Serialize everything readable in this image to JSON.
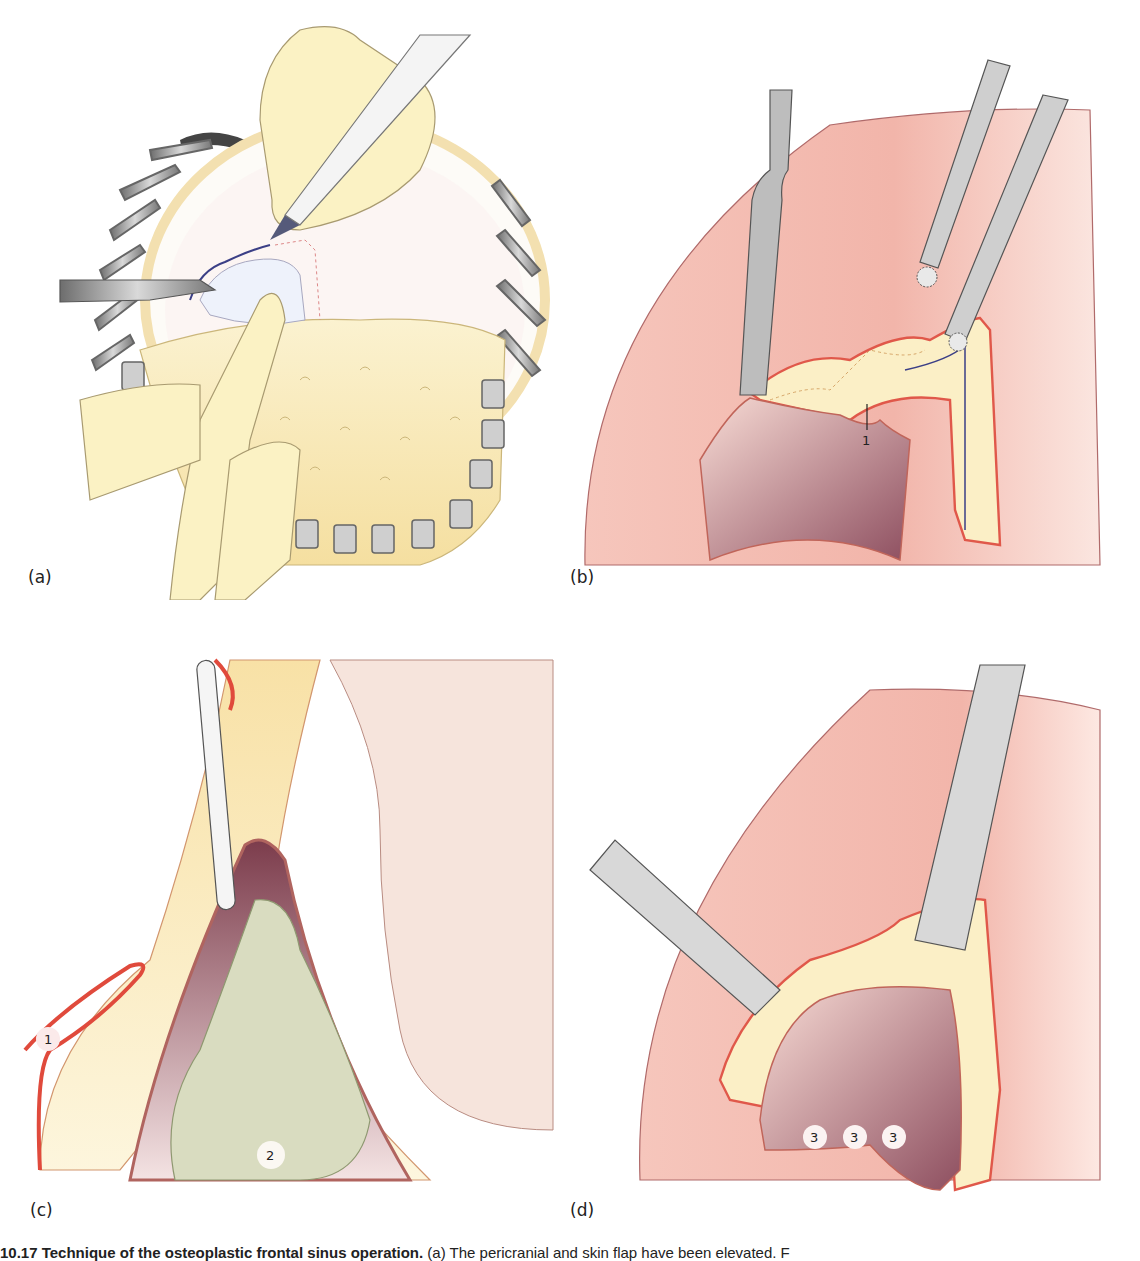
{
  "figure": {
    "panels": [
      {
        "id": "a",
        "label": "(a)",
        "description": "Osteoplastic flap: frontal bone exposure with retractors, surgeon's fingers, marking pen and scalpel"
      },
      {
        "id": "b",
        "label": "(b)",
        "description": "Frontal sinus opened with elevator and burs",
        "callouts": [
          "1"
        ]
      },
      {
        "id": "c",
        "label": "(c)",
        "description": "Sagittal section with probe in sinus, contents",
        "callouts": [
          "1",
          "2"
        ]
      },
      {
        "id": "d",
        "label": "(d)",
        "description": "Sinus cavity with chisels",
        "callouts": [
          "3",
          "3",
          "3"
        ]
      }
    ],
    "caption": {
      "number": "10.17",
      "title": "Technique of the osteoplastic frontal sinus operation.",
      "text": "(a) The pericranial and skin flap have been elevated. F"
    }
  },
  "colors": {
    "tissue_pink": "#f2b7ad",
    "tissue_light": "#fbe3dc",
    "bone_yellow": "#f8e6b0",
    "mucosa_red": "#e2574a",
    "cavity_dark": "#8a4a5a",
    "instrument_gray": "#b9b9b9",
    "skin_glove": "#fbf2c4",
    "polyp_green": "#d9dcc0"
  }
}
